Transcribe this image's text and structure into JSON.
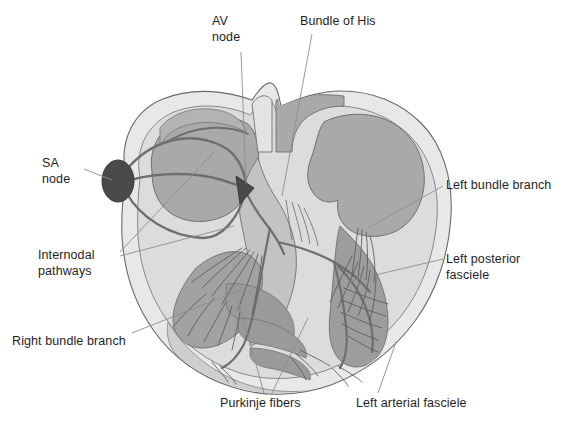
{
  "figure": {
    "background_color": "#ffffff"
  },
  "palette": {
    "outer_myocardium": "#e6e6e6",
    "myocardium_mid": "#d2d2d2",
    "chamber_fill": "#a9a9a9",
    "chamber_fill_dark": "#989898",
    "septum": "#b5b5b5",
    "node_dark": "#4a4a4a",
    "conduction_line": "#6e6e6e",
    "outline": "#5a5a5a",
    "leader_line": "#8a8a8a",
    "label_text": "#1e1e1e"
  },
  "labels": [
    {
      "id": "sa-node",
      "text": "SA\nnode",
      "x": 42,
      "y": 156,
      "align": "left",
      "leader": {
        "x1": 84,
        "y1": 169,
        "x2": 116,
        "y2": 180
      }
    },
    {
      "id": "av-node",
      "text": "AV\nnode",
      "x": 212,
      "y": 14,
      "align": "left",
      "leader": {
        "x1": 241,
        "y1": 52,
        "x2": 246,
        "y2": 184
      }
    },
    {
      "id": "bundle-of-his",
      "text": "Bundle of His",
      "x": 300,
      "y": 14,
      "align": "left",
      "leader": {
        "x1": 312,
        "y1": 32,
        "x2": 284,
        "y2": 195
      }
    },
    {
      "id": "internodal-pathways",
      "text": "Internodal\npathways",
      "x": 38,
      "y": 248,
      "align": "left",
      "leader": {
        "x1": 118,
        "y1": 254,
        "x2": 212,
        "y2": 153
      },
      "leader2": {
        "x1": 118,
        "y1": 258,
        "x2": 232,
        "y2": 225
      }
    },
    {
      "id": "right-bundle-branch",
      "text": "Right bundle branch",
      "x": 12,
      "y": 334,
      "align": "left",
      "leader": {
        "x1": 130,
        "y1": 334,
        "x2": 248,
        "y2": 288
      }
    },
    {
      "id": "purkinje-fibers",
      "text": "Purkinje fibers",
      "x": 220,
      "y": 396,
      "align": "left",
      "leader": {
        "x1": 264,
        "y1": 394,
        "x2": 238,
        "y2": 302
      },
      "leader2": {
        "x1": 272,
        "y1": 394,
        "x2": 306,
        "y2": 318
      }
    },
    {
      "id": "left-arterial-fasciele",
      "text": "Left arterial fasciele",
      "x": 356,
      "y": 396,
      "align": "left",
      "leader": {
        "x1": 378,
        "y1": 394,
        "x2": 394,
        "y2": 344
      }
    },
    {
      "id": "left-bundle-branch",
      "text": "Left bundle branch",
      "x": 446,
      "y": 178,
      "align": "left",
      "leader": {
        "x1": 442,
        "y1": 186,
        "x2": 370,
        "y2": 228
      }
    },
    {
      "id": "left-posterior-fasciele",
      "text": "Left posterior\nfasciele",
      "x": 446,
      "y": 252,
      "align": "left",
      "leader": {
        "x1": 442,
        "y1": 260,
        "x2": 352,
        "y2": 282
      }
    }
  ],
  "anatomy": {
    "structures": [
      "right atrium",
      "left atrium",
      "right ventricle",
      "left ventricle",
      "interventricular septum",
      "superior vena cava opening",
      "tricuspid valve",
      "mitral valve",
      "papillary muscles",
      "chordae tendineae"
    ],
    "conduction_nodes": [
      {
        "name": "SA node",
        "shape": "filled-ellipse",
        "cx": 118,
        "cy": 181,
        "rx": 16,
        "ry": 21
      },
      {
        "name": "AV node",
        "shape": "filled-triangle",
        "cx": 245,
        "cy": 190
      }
    ]
  }
}
